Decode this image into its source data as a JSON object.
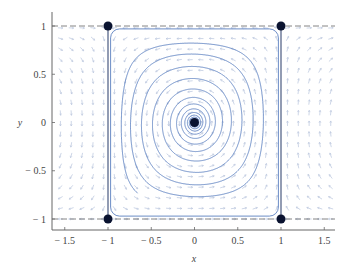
{
  "chart_data": {
    "type": "phase_portrait",
    "title": "",
    "xlabel": "x",
    "ylabel": "y",
    "xlim": [
      -1.65,
      1.65
    ],
    "ylim": [
      -1.1,
      1.1
    ],
    "x_ticks": [
      -1.5,
      -1,
      -0.5,
      0,
      0.5,
      1,
      1.5
    ],
    "x_tick_labels": [
      "− 1.5",
      "− 1",
      "− 0.5",
      "0",
      "0.5",
      "1",
      "1.5"
    ],
    "y_ticks": [
      -1,
      -0.5,
      0,
      0.5,
      1
    ],
    "y_tick_labels": [
      "− 1",
      "− 0.5",
      "0",
      "0.5",
      "1"
    ],
    "grid": false,
    "reference_lines": {
      "horizontal_dashed": [
        -1,
        1
      ],
      "vertical_solid": [
        -1,
        1
      ]
    },
    "equilibria": [
      {
        "x": -1,
        "y": 1
      },
      {
        "x": 1,
        "y": 1
      },
      {
        "x": -1,
        "y": -1
      },
      {
        "x": 1,
        "y": -1
      },
      {
        "x": 0,
        "y": 0
      }
    ],
    "trajectories": {
      "description": "Spiral orbits around origin approaching a square heteroclinic cycle through (±1, ±1)",
      "color": "#5a7fc0",
      "count": 1
    },
    "vector_field": {
      "grid_x_range": [
        -1.5,
        1.5
      ],
      "grid_y_range": [
        -1.0,
        1.0
      ],
      "color": "#b8c4dc"
    },
    "colors": {
      "trajectory": "#5a7fc0",
      "equilibrium": "#0a1330",
      "axis": "#555555",
      "arrows": "#b8c4dc"
    }
  }
}
